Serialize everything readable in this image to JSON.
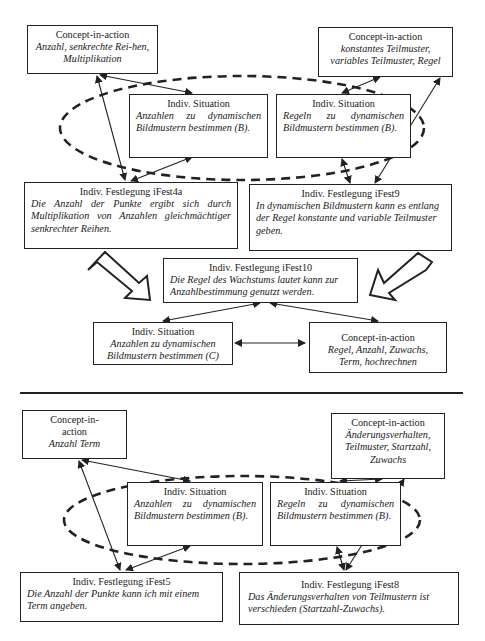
{
  "top": {
    "cia_left": {
      "title": "Concept-in-action",
      "body": "Anzahl, senkrechte Rei-hen, Multiplikation"
    },
    "cia_right": {
      "title": "Concept-in-action",
      "body": "konstantes Teilmuster, variables Teilmuster, Regel"
    },
    "situation_left": {
      "title": "Indiv. Situation",
      "body": "Anzahlen zu dynamischen Bildmustern bestimmen (B)."
    },
    "situation_right": {
      "title": "Indiv. Situation",
      "body": "Regeln zu dynamischen Bildmustern bestimmen (B)."
    },
    "fest4a": {
      "title": "Indiv. Festlegung iFest4a",
      "body": "Die Anzahl der Punkte ergibt sich durch Multiplikation von Anzahlen gleichmächtiger senkrechter Reihen."
    },
    "fest9": {
      "title": "Indiv. Festlegung iFest9",
      "body": "In dynamischen Bildmustern kann es entlang der Regel konstante und variable Teilmuster geben."
    },
    "fest10": {
      "title": "Indiv. Festlegung iFest10",
      "body": "Die Regel des Wachstums lautet kann zur Anzahlbestimmung genutzt werden."
    },
    "situation_c": {
      "title": "Indiv. Situation",
      "body": "Anzahlen zu dynamischen Bildmustern bestimmen (C)"
    },
    "cia_c": {
      "title": "Concept-in-action",
      "body": "Regel, Anzahl, Zuwachs, Term, hochrechnen"
    }
  },
  "bottom": {
    "cia_left": {
      "title": "Concept-in-action",
      "body": "Anzahl Term"
    },
    "cia_right": {
      "title": "Concept-in-action",
      "body": "Änderungsverhalten, Teilmuster, Startzahl, Zuwachs"
    },
    "situation_left": {
      "title": "Indiv. Situation",
      "body": "Anzahlen zu dynamischen Bildmustern bestimmen (B)."
    },
    "situation_right": {
      "title": "Indiv. Situation",
      "body": "Regeln zu dynamischen Bildmustern bestimmen (B)."
    },
    "fest5": {
      "title": "Indiv. Festlegung iFest5",
      "body": "Die Anzahl der Punkte kann ich mit einem Term angeben."
    },
    "fest8": {
      "title": "Indiv. Festlegung iFest8",
      "body": "Das Änderungsverhalten von Teilmustern ist verschieden (Startzahl-Zuwachs)."
    }
  },
  "colors": {
    "line": "#222222",
    "background": "#ffffff"
  }
}
